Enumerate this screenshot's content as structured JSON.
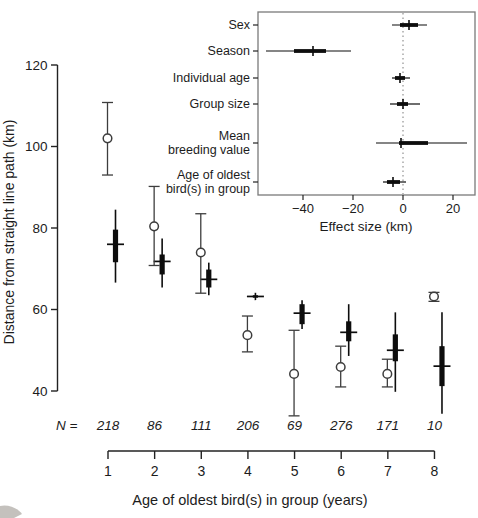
{
  "figure": {
    "colors": {
      "observed_series": "#3d3d3d",
      "estimate_series": "#0d0d0d",
      "frame": "#7a7a7a",
      "zero_line": "#9a9a9a",
      "text": "#1c1c1c",
      "artifact": "#b5b2ad"
    }
  },
  "chart_data": [
    {
      "name": "main-plot",
      "type": "scatter",
      "xlabel": "Age of oldest bird(s) in group (years)",
      "ylabel": "Distance from straight line path (km)",
      "xticks": [
        1,
        2,
        3,
        4,
        5,
        6,
        7,
        8
      ],
      "yticks": [
        40,
        60,
        80,
        100,
        120
      ],
      "ylim": [
        40,
        120
      ],
      "n_prefix": "N =",
      "sample_sizes": [
        218,
        86,
        111,
        206,
        69,
        276,
        171,
        10
      ],
      "series": [
        {
          "name": "observed-mean-ci",
          "marker": "open-circle-whisker",
          "points": [
            {
              "age": 1,
              "mean": 102.0,
              "lo": 93.0,
              "hi": 110.8
            },
            {
              "age": 2,
              "mean": 80.4,
              "lo": 70.8,
              "hi": 90.2
            },
            {
              "age": 3,
              "mean": 74.0,
              "lo": 64.0,
              "hi": 83.5
            },
            {
              "age": 4,
              "mean": 53.7,
              "lo": 49.6,
              "hi": 58.4
            },
            {
              "age": 5,
              "mean": 44.2,
              "lo": 33.9,
              "hi": 54.9
            },
            {
              "age": 6,
              "mean": 45.9,
              "lo": 41.0,
              "hi": 51.0
            },
            {
              "age": 7,
              "mean": 44.2,
              "lo": 41.0,
              "hi": 47.8
            },
            {
              "age": 8,
              "mean": 63.2,
              "lo": 62.0,
              "hi": 64.2
            }
          ]
        },
        {
          "name": "model-estimate",
          "marker": "thick-bar-crossbar",
          "points": [
            {
              "age": 1,
              "est": 76.0,
              "thick_lo": 71.6,
              "thick_hi": 79.6,
              "thin_lo": 66.6,
              "thin_hi": 84.5
            },
            {
              "age": 2,
              "est": 71.8,
              "thick_lo": 68.6,
              "thick_hi": 73.5,
              "thin_lo": 65.4,
              "thin_hi": 77.4
            },
            {
              "age": 3,
              "est": 67.4,
              "thick_lo": 65.4,
              "thick_hi": 69.8,
              "thin_lo": 63.5,
              "thin_hi": 71.5
            },
            {
              "age": 4,
              "est": 63.2,
              "thick_lo": 62.9,
              "thick_hi": 63.5,
              "thin_lo": 62.3,
              "thin_hi": 64.1
            },
            {
              "age": 5,
              "est": 59.1,
              "thick_lo": 56.4,
              "thick_hi": 61.3,
              "thin_lo": 55.2,
              "thin_hi": 62.3
            },
            {
              "age": 6,
              "est": 54.4,
              "thick_lo": 52.2,
              "thick_hi": 57.1,
              "thin_lo": 48.6,
              "thin_hi": 61.3
            },
            {
              "age": 7,
              "est": 50.0,
              "thick_lo": 47.3,
              "thick_hi": 53.9,
              "thin_lo": 39.8,
              "thin_hi": 59.3
            },
            {
              "age": 8,
              "est": 46.1,
              "thick_lo": 41.2,
              "thick_hi": 51.0,
              "thin_lo": 34.4,
              "thin_hi": 59.3
            }
          ]
        }
      ]
    },
    {
      "name": "effect-size-inset",
      "type": "forest",
      "xlabel": "Effect size (km)",
      "xticks": [
        -40,
        -20,
        0,
        20
      ],
      "xlim": [
        -58,
        28.8
      ],
      "zero_reference_line": 0,
      "rows": [
        {
          "label": "Sex",
          "label_lines": [
            "Sex"
          ],
          "est": 2.4,
          "thick": [
            -1.2,
            6.0
          ],
          "thin": [
            -4.4,
            9.6
          ]
        },
        {
          "label": "Season",
          "label_lines": [
            "Season"
          ],
          "est": -36.0,
          "thick": [
            -43.6,
            -30.8
          ],
          "thin": [
            -54.8,
            -20.8
          ]
        },
        {
          "label": "Individual age",
          "label_lines": [
            "Individual age"
          ],
          "est": -1.2,
          "thick": [
            -3.2,
            0.8
          ],
          "thin": [
            -4.4,
            2.8
          ]
        },
        {
          "label": "Group size",
          "label_lines": [
            "Group size"
          ],
          "est": 0.0,
          "thick": [
            -2.4,
            2.0
          ],
          "thin": [
            -5.2,
            6.8
          ]
        },
        {
          "label": "Mean breeding value",
          "label_lines": [
            "Mean",
            "breeding value"
          ],
          "est": -0.8,
          "thick": [
            -1.6,
            10.0
          ],
          "thin": [
            -10.8,
            25.6
          ]
        },
        {
          "label": "Age of oldest bird(s) in group",
          "label_lines": [
            "Age of oldest",
            "bird(s) in group"
          ],
          "est": -4.0,
          "thick": [
            -6.4,
            -1.2
          ],
          "thin": [
            -8.0,
            1.2
          ]
        }
      ]
    }
  ]
}
